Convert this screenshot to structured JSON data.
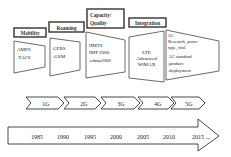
{
  "diagram": {
    "title": "",
    "stages": [
      {
        "label": "Mobility",
        "technologies": [
          "AMPS",
          ".TACS"
        ]
      },
      {
        "label": "Roaming",
        "technologies": [
          "GPRS",
          ".GSM"
        ]
      },
      {
        "label_lines": [
          "Capacity/",
          "Quality"
        ],
        "technologies": [
          "IIMTS",
          "IMT-2000",
          ".cdma2000"
        ]
      },
      {
        "label": "Integration",
        "technologies": [
          "LTE",
          "Advanced",
          "WiMAX"
        ]
      },
      {
        "label": "",
        "technologies": [
          "5G",
          "Research, proto-",
          "type, trial",
          ".5G standard",
          ".product",
          ".deployment"
        ]
      }
    ],
    "generations": [
      "1G",
      "2G",
      "3G",
      "4G",
      "5G"
    ],
    "timeline": [
      "1985",
      "1990",
      "1995",
      "2000",
      "2005",
      "2010",
      "2015"
    ],
    "timeline_suffix": "..."
  },
  "colors": {
    "stroke": "#333333",
    "fill": "#ffffff",
    "text": "#222222"
  }
}
